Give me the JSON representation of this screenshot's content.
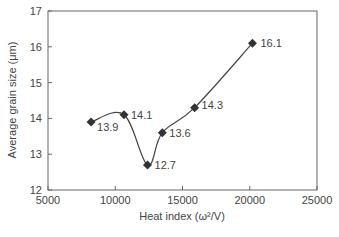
{
  "chart_data": {
    "type": "line",
    "title": "",
    "xlabel": "Heat index (ω²/V)",
    "ylabel": "Average grain size (μm)",
    "xlim": [
      5000,
      25000
    ],
    "ylim": [
      12,
      17
    ],
    "x_ticks": [
      "5000",
      "10000",
      "15000",
      "20000",
      "25000"
    ],
    "y_ticks": [
      "12",
      "13",
      "14",
      "15",
      "16",
      "17"
    ],
    "grid": false,
    "legend": null,
    "marker": "diamond",
    "line_style": "smooth",
    "series": [
      {
        "name": "Average grain size",
        "x": [
          8200,
          10650,
          12400,
          13500,
          15900,
          20200
        ],
        "values": [
          13.9,
          14.1,
          12.7,
          13.6,
          14.3,
          16.1
        ],
        "labels": [
          "13.9",
          "14.1",
          "12.7",
          "13.6",
          "14.3",
          "16.1"
        ],
        "color": "#333333"
      }
    ]
  }
}
